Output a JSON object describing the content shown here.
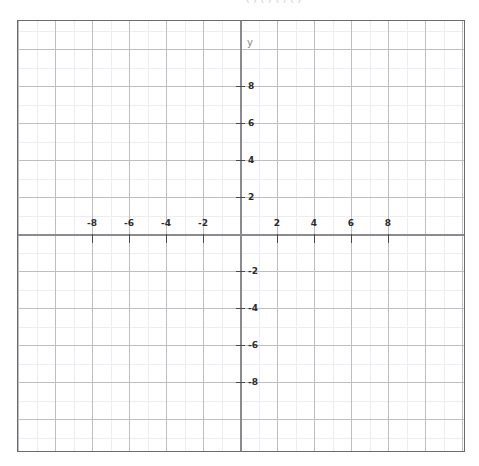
{
  "top_caption": {
    "text": "(  )  (  )  (  )  (  )"
  },
  "graph": {
    "x_axis_name": "x",
    "y_axis_name": "y",
    "x_tick_labels": [
      "-8",
      "-6",
      "-4",
      "-2",
      "2",
      "4",
      "6",
      "8"
    ],
    "y_tick_labels": [
      "8",
      "6",
      "4",
      "2",
      "-2",
      "-4",
      "-6",
      "-8"
    ]
  },
  "chart_data": {
    "type": "scatter",
    "title": "",
    "xlabel": "x",
    "ylabel": "y",
    "xlim": [
      -12,
      12.1
    ],
    "ylim": [
      -11.5,
      11.5
    ],
    "x_ticks": [
      -8,
      -6,
      -4,
      -2,
      2,
      4,
      6,
      8
    ],
    "y_ticks": [
      8,
      6,
      4,
      2,
      -2,
      -4,
      -6,
      -8
    ],
    "x_tick_labels": [
      "-8",
      "-6",
      "-4",
      "-2",
      "2",
      "4",
      "6",
      "8"
    ],
    "y_tick_labels": [
      "8",
      "6",
      "4",
      "2",
      "-2",
      "-4",
      "-6",
      "-8"
    ],
    "major_grid_step": 2,
    "minor_grid_step": 1,
    "grid": true,
    "legend": false,
    "series": [],
    "x": [],
    "values": [],
    "annotations": []
  },
  "layout": {
    "origin_x_px": 222,
    "origin_y_px": 213,
    "unit_px": 18.5,
    "plot_left_px": 17,
    "plot_top_px": 20,
    "plot_width_px": 448,
    "plot_height_px": 432,
    "colors": {
      "axis": "#8b8b8f",
      "major_grid": "#bdbdc4",
      "minor_grid": "#ececf2",
      "border": "#6a6a6a",
      "tick": "#4a4a4a",
      "label": "#2b2b2b",
      "axis_name": "#8a8a8a"
    }
  }
}
